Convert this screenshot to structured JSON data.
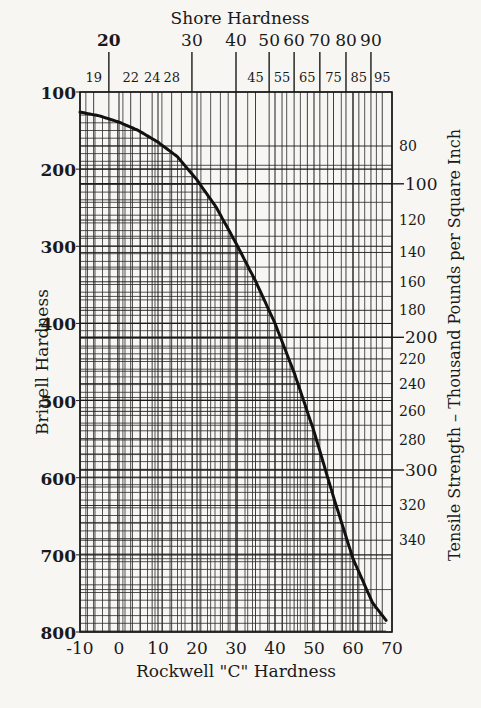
{
  "chart_data": {
    "type": "line",
    "title": "",
    "xlabel": "Rockwell \"C\" Hardness",
    "ylabel": "Brinell Hardness",
    "top_axis_label": "Shore Hardness",
    "right_axis_label": "Tensile Strength – Thousand Pounds per Square Inch",
    "xlim": [
      -10,
      70
    ],
    "ylim": [
      100,
      800
    ],
    "y_inverted": true,
    "grid": true,
    "x_ticks": [
      -10,
      0,
      10,
      20,
      30,
      40,
      50,
      60,
      70
    ],
    "y_ticks": [
      100,
      200,
      300,
      400,
      500,
      600,
      700,
      800
    ],
    "shore_major_ticks": [
      {
        "label": "20",
        "rockwell": -2.6
      },
      {
        "label": "30",
        "rockwell": 18.7
      },
      {
        "label": "40",
        "rockwell": 30.0
      },
      {
        "label": "50",
        "rockwell": 38.5
      },
      {
        "label": "60",
        "rockwell": 44.9
      },
      {
        "label": "70",
        "rockwell": 51.5
      },
      {
        "label": "80",
        "rockwell": 58.2
      },
      {
        "label": "90",
        "rockwell": 64.6
      }
    ],
    "shore_minor_ticks": [
      {
        "label": "19",
        "rockwell": -6.5
      },
      {
        "label": "22",
        "rockwell": 3.0
      },
      {
        "label": "24",
        "rockwell": 8.5
      },
      {
        "label": "28",
        "rockwell": 13.5
      },
      {
        "label": "45",
        "rockwell": 35.0
      },
      {
        "label": "55",
        "rockwell": 41.8
      },
      {
        "label": "65",
        "rockwell": 48.3
      },
      {
        "label": "75",
        "rockwell": 55.0
      },
      {
        "label": "85",
        "rockwell": 61.5
      },
      {
        "label": "95",
        "rockwell": 67.5
      }
    ],
    "tensile_ticks": [
      {
        "label": "80",
        "brinell": 170,
        "major": false
      },
      {
        "label": "100",
        "brinell": 219,
        "major": true
      },
      {
        "label": "120",
        "brinell": 266,
        "major": false
      },
      {
        "label": "140",
        "brinell": 308,
        "major": false
      },
      {
        "label": "160",
        "brinell": 346,
        "major": false
      },
      {
        "label": "180",
        "brinell": 383,
        "major": false
      },
      {
        "label": "200",
        "brinell": 418,
        "major": true
      },
      {
        "label": "220",
        "brinell": 446,
        "major": false
      },
      {
        "label": "240",
        "brinell": 478,
        "major": false
      },
      {
        "label": "260",
        "brinell": 514,
        "major": false
      },
      {
        "label": "280",
        "brinell": 551,
        "major": false
      },
      {
        "label": "300",
        "brinell": 590,
        "major": true
      },
      {
        "label": "320",
        "brinell": 636,
        "major": false
      },
      {
        "label": "340",
        "brinell": 681,
        "major": false
      }
    ],
    "series": [
      {
        "name": "Brinell vs Rockwell C",
        "x": [
          -10,
          -5,
          0,
          5,
          10,
          15,
          20,
          25,
          30,
          35,
          40,
          45,
          50,
          55,
          60,
          65,
          68.5
        ],
        "y": [
          126,
          131,
          139,
          150,
          165,
          184,
          214,
          250,
          296,
          345,
          400,
          465,
          540,
          625,
          705,
          762,
          785
        ]
      }
    ]
  }
}
